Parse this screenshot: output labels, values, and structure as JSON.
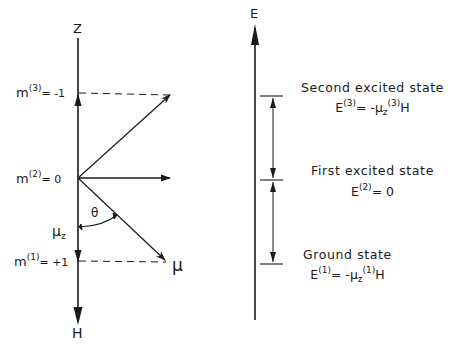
{
  "left_diagram": {
    "axis_label_top": "Z",
    "axis_label_bottom": "H",
    "levels": [
      {
        "m_label": "m",
        "superscript": "(3)",
        "value": "= -1"
      },
      {
        "m_label": "m",
        "superscript": "(2)",
        "value": "= 0"
      },
      {
        "m_label": "m",
        "superscript": "(1)",
        "value": "= +1"
      }
    ],
    "angle_label": "θ",
    "mu_z_label": "μ",
    "mu_z_subscript": "z",
    "mu_label": "μ"
  },
  "right_diagram": {
    "axis_label": "E",
    "states": [
      {
        "name": "Second excited state",
        "eq_prefix": "E",
        "eq_sup": "(3)",
        "eq_mid": "= -μ",
        "eq_sub": "z",
        "eq_sup2": "(3)",
        "eq_suffix": "H"
      },
      {
        "name": "First excited state",
        "eq_prefix": "E",
        "eq_sup": "(2)",
        "eq_mid": "= 0",
        "eq_sub": "",
        "eq_sup2": "",
        "eq_suffix": ""
      },
      {
        "name": "Ground state",
        "eq_prefix": "E",
        "eq_sup": "(1)",
        "eq_mid": "= -μ",
        "eq_sub": "z",
        "eq_sup2": "(1)",
        "eq_suffix": "H"
      }
    ]
  },
  "colors": {
    "ink": "#1a1a1a",
    "background": "#ffffff"
  }
}
